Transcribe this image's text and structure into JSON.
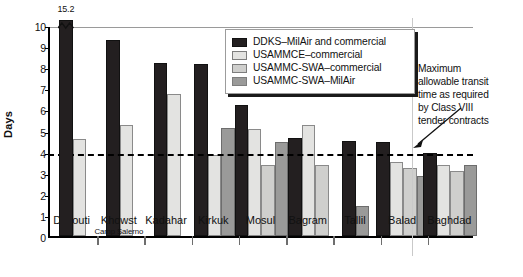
{
  "chart_data": {
    "type": "bar",
    "title": "",
    "xlabel": "",
    "ylabel": "Days",
    "ylim": [
      0,
      10
    ],
    "yticks": [
      0,
      1,
      2,
      3,
      4,
      5,
      6,
      7,
      8,
      9,
      10
    ],
    "grid": false,
    "legend_position": "upper-center",
    "categories": [
      "Djibouti",
      "Khowst",
      "Kadahar",
      "Kirkuk",
      "Mosul",
      "Bagram",
      "Tallil",
      "Balad",
      "Baghdad"
    ],
    "category_sublabels": [
      "",
      "Camp Salerno",
      "",
      "",
      "",
      "",
      "",
      "",
      ""
    ],
    "series": [
      {
        "name": "DDKS–MilAir and commercial",
        "color": "#231f20",
        "values": [
          15.2,
          9.3,
          8.2,
          8.15,
          6.2,
          4.65,
          4.5,
          4.45,
          3.95
        ]
      },
      {
        "name": "USAMMCE–commercial",
        "color": "#e3e3e1",
        "values": [
          4.6,
          5.25,
          6.75,
          3.85,
          5.05,
          5.25,
          null,
          3.5,
          3.35
        ]
      },
      {
        "name": "USAMMC-SWA–commercial",
        "color": "#cfcfcd",
        "values": [
          null,
          null,
          null,
          null,
          3.35,
          3.35,
          null,
          3.2,
          3.1
        ]
      },
      {
        "name": "USAMMC-SWA–MilAir",
        "color": "#9a9a99",
        "values": [
          null,
          null,
          null,
          5.1,
          4.45,
          null,
          1.4,
          2.85,
          3.35
        ]
      }
    ],
    "broken_bar": {
      "category": "Djibouti",
      "series": "DDKS–MilAir and commercial",
      "label": "15.2"
    },
    "threshold": {
      "value": 4,
      "style": "dashed",
      "annotation": "Maximum allowable transit time as required by Class VIII tender contracts"
    }
  },
  "annotation_lines": [
    "Maximum",
    "allowable transit",
    "time as required",
    "by Class VIII",
    "tender contracts"
  ]
}
